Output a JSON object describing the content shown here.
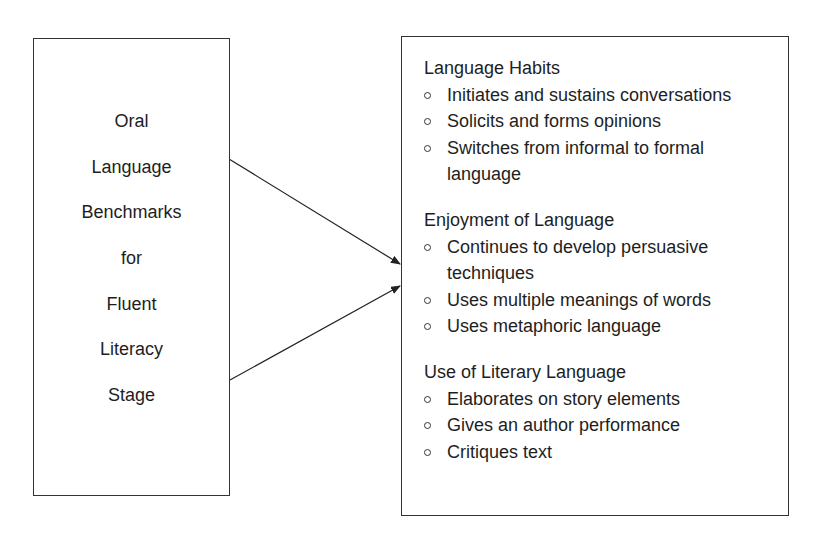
{
  "left_box": {
    "words": [
      "Oral",
      "Language",
      "Benchmarks",
      "for",
      "Fluent",
      "Literacy",
      "Stage"
    ]
  },
  "right_box": {
    "sections": [
      {
        "heading": "Language Habits",
        "items": [
          [
            "Initiates and sustains conversations"
          ],
          [
            "Solicits and forms opinions"
          ],
          [
            "Switches from informal to formal",
            "language"
          ]
        ]
      },
      {
        "heading": "Enjoyment of Language",
        "items": [
          [
            "Continues to develop persuasive",
            "techniques"
          ],
          [
            "Uses multiple meanings of words"
          ],
          [
            "Uses metaphoric language"
          ]
        ]
      },
      {
        "heading": "Use of Literary Language",
        "items": [
          [
            "Elaborates on story elements"
          ],
          [
            "Gives an author performance"
          ],
          [
            "Critiques text"
          ]
        ]
      }
    ]
  },
  "colors": {
    "line": "#222222",
    "text": "#1e1e1e"
  }
}
